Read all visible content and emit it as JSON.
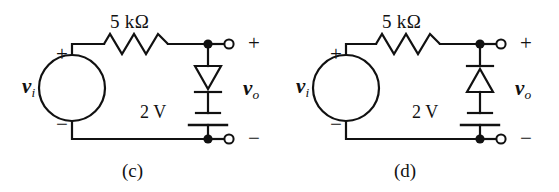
{
  "figure": {
    "background_color": "#ffffff",
    "ink_color": "#111111",
    "panel_count": 2
  },
  "panels": [
    {
      "id": "c",
      "caption": "(c)",
      "source": {
        "name": "vi",
        "symbol": "v",
        "subscript": "i",
        "plus_label": "+",
        "minus_label": "−",
        "shape": "circle"
      },
      "resistor": {
        "label": "5 kΩ",
        "value": "5",
        "unit": "kΩ",
        "orientation": "horizontal",
        "peaks": 4
      },
      "diode": {
        "label": "",
        "orientation": "vertical",
        "triangle_direction": "down",
        "cathode_position": "bottom"
      },
      "battery": {
        "label": "2 V",
        "value": "2",
        "unit": "V",
        "orientation": "vertical",
        "short_plate": "top",
        "long_plate": "bottom"
      },
      "output": {
        "name": "vo",
        "symbol": "v",
        "subscript": "o",
        "plus_label": "+",
        "minus_label": "−",
        "terminal_style": "open-circle",
        "junction_style": "filled-dot"
      }
    },
    {
      "id": "d",
      "caption": "(d)",
      "source": {
        "name": "vi",
        "symbol": "v",
        "subscript": "i",
        "plus_label": "+",
        "minus_label": "−",
        "shape": "circle"
      },
      "resistor": {
        "label": "5 kΩ",
        "value": "5",
        "unit": "kΩ",
        "orientation": "horizontal",
        "peaks": 4
      },
      "diode": {
        "label": "",
        "orientation": "vertical",
        "triangle_direction": "up",
        "cathode_position": "top"
      },
      "battery": {
        "label": "2 V",
        "value": "2",
        "unit": "V",
        "orientation": "vertical",
        "short_plate": "top",
        "long_plate": "bottom"
      },
      "output": {
        "name": "vo",
        "symbol": "v",
        "subscript": "o",
        "plus_label": "+",
        "minus_label": "−",
        "terminal_style": "open-circle",
        "junction_style": "filled-dot"
      }
    }
  ]
}
